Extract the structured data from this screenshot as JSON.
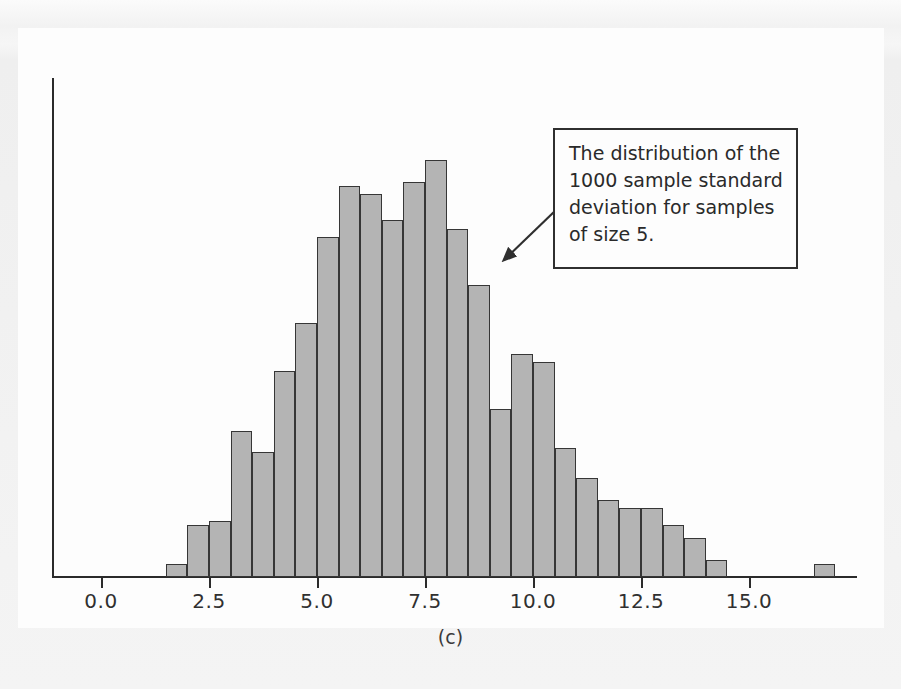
{
  "figure": {
    "panel_label": "(c)",
    "background_color": "#f3f3f3",
    "panel_color": "#fdfdfd",
    "bar_fill_color": "#b4b4b4",
    "bar_edge_color": "#363636",
    "axis_color": "#2b2b2b"
  },
  "annotation": {
    "text": "The distribution of the\n1000 sample standard\ndeviation for samples\nof size 5.",
    "arrow_name": "callout-arrow"
  },
  "chart_data": {
    "type": "bar",
    "title": "",
    "subtitle": "",
    "xlabel": "",
    "ylabel": "",
    "xlim": [
      -0.4,
      17.5
    ],
    "ylim": [
      0,
      104
    ],
    "grid": false,
    "legend": null,
    "bin_width": 0.5,
    "xticks": [
      0.0,
      2.5,
      5.0,
      7.5,
      10.0,
      12.5,
      15.0
    ],
    "xtick_labels": [
      "0.0",
      "2.5",
      "5.0",
      "7.5",
      "10.0",
      "12.5",
      "15.0"
    ],
    "yticks": [],
    "ytick_labels": [],
    "bin_starts": [
      1.5,
      2.0,
      2.5,
      3.0,
      3.5,
      4.0,
      4.5,
      5.0,
      5.5,
      6.0,
      6.5,
      7.0,
      7.5,
      8.0,
      8.5,
      9.0,
      9.5,
      10.0,
      10.5,
      11.0,
      11.5,
      12.0,
      12.5,
      13.0,
      13.5,
      14.0,
      16.5
    ],
    "categories": [
      "1.5-2.0",
      "2.0-2.5",
      "2.5-3.0",
      "3.0-3.5",
      "3.5-4.0",
      "4.0-4.5",
      "4.5-5.0",
      "5.0-5.5",
      "5.5-6.0",
      "6.0-6.5",
      "6.5-7.0",
      "7.0-7.5",
      "7.5-8.0",
      "8.0-8.5",
      "8.5-9.0",
      "9.0-9.5",
      "9.5-10.0",
      "10.0-10.5",
      "10.5-11.0",
      "11.0-11.5",
      "11.5-12.0",
      "12.0-12.5",
      "12.5-13.0",
      "13.0-13.5",
      "13.5-14.0",
      "14.0-14.5",
      "16.5-17.0"
    ],
    "values": [
      3,
      12,
      13,
      34,
      29,
      48,
      59,
      79,
      91,
      89,
      83,
      92,
      97,
      81,
      68,
      39,
      52,
      50,
      30,
      23,
      18,
      16,
      16,
      12,
      9,
      4,
      3
    ]
  }
}
